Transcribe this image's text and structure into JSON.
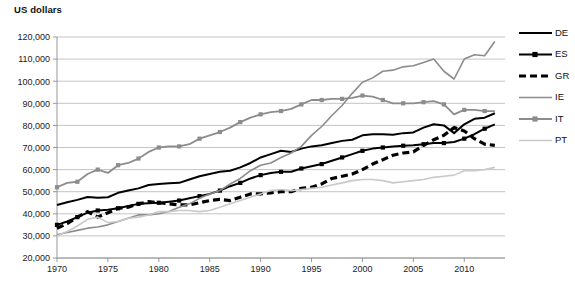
{
  "axis_title": "US dollars",
  "colors": {
    "DE": "#000000",
    "ES": "#000000",
    "GR": "#000000",
    "IE": "#8c8c8c",
    "IT": "#8c8c8c",
    "PT": "#c9c9c9",
    "grid": "#aaaaaa",
    "axis": "#8d8d8d"
  },
  "legend": {
    "position": "right",
    "items": [
      {
        "label": "DE",
        "style": "solid",
        "marker": "none",
        "color": "#000000",
        "width": 2.0
      },
      {
        "label": "ES",
        "style": "solid",
        "marker": "square",
        "color": "#000000",
        "width": 2.0
      },
      {
        "label": "GR",
        "style": "dashed",
        "marker": "none",
        "color": "#000000",
        "width": 3.2
      },
      {
        "label": "IE",
        "style": "solid",
        "marker": "none",
        "color": "#8c8c8c",
        "width": 1.6
      },
      {
        "label": "IT",
        "style": "solid",
        "marker": "square",
        "color": "#8c8c8c",
        "width": 1.8
      },
      {
        "label": "PT",
        "style": "solid",
        "marker": "none",
        "color": "#c9c9c9",
        "width": 1.6
      }
    ]
  },
  "chart_data": {
    "type": "line",
    "title": "",
    "xlabel": "",
    "ylabel": "US dollars",
    "xlim": [
      1970,
      2014
    ],
    "ylim": [
      20000,
      120000
    ],
    "ytick_values": [
      20000,
      30000,
      40000,
      50000,
      60000,
      70000,
      80000,
      90000,
      100000,
      110000,
      120000
    ],
    "ytick_labels": [
      "20,000",
      "30,000",
      "40,000",
      "50,000",
      "60,000",
      "70,000",
      "80,000",
      "90,000",
      "100,000",
      "110,000",
      "120,000"
    ],
    "xtick_values": [
      1970,
      1975,
      1980,
      1985,
      1990,
      1995,
      2000,
      2005,
      2010
    ],
    "xtick_labels": [
      "1970",
      "1975",
      "1980",
      "1985",
      "1990",
      "1995",
      "2000",
      "2005",
      "2010"
    ],
    "grid": "horizontal",
    "x": [
      1970,
      1971,
      1972,
      1973,
      1974,
      1975,
      1976,
      1977,
      1978,
      1979,
      1980,
      1981,
      1982,
      1983,
      1984,
      1985,
      1986,
      1987,
      1988,
      1989,
      1990,
      1991,
      1992,
      1993,
      1994,
      1995,
      1996,
      1997,
      1998,
      1999,
      2000,
      2001,
      2002,
      2003,
      2004,
      2005,
      2006,
      2007,
      2008,
      2009,
      2010,
      2011,
      2012,
      2013
    ],
    "series": [
      {
        "name": "DE",
        "values": [
          44000,
          45200,
          46300,
          47600,
          47300,
          47500,
          49500,
          50500,
          51500,
          53000,
          53500,
          53800,
          54000,
          55500,
          57000,
          58000,
          59000,
          59500,
          61000,
          63000,
          65500,
          67000,
          68500,
          68000,
          69500,
          70500,
          71000,
          72000,
          73000,
          73500,
          75500,
          76000,
          76000,
          75800,
          76500,
          76800,
          79000,
          80500,
          80000,
          76500,
          80500,
          83000,
          83500,
          85500
        ]
      },
      {
        "name": "ES",
        "values": [
          35000,
          36500,
          38500,
          40500,
          41500,
          41800,
          42500,
          43500,
          44500,
          44800,
          45000,
          45500,
          46000,
          47000,
          48000,
          49000,
          50500,
          52500,
          54000,
          56000,
          57500,
          58500,
          59000,
          59000,
          60500,
          61500,
          62500,
          64000,
          65500,
          67000,
          68500,
          69500,
          70000,
          70500,
          70800,
          71000,
          71500,
          72000,
          72000,
          72500,
          74000,
          76000,
          78500,
          80500
        ]
      },
      {
        "name": "GR",
        "values": [
          33500,
          35500,
          38500,
          41000,
          38500,
          40500,
          42500,
          43000,
          44500,
          45500,
          45000,
          44500,
          44000,
          44000,
          45000,
          46000,
          46500,
          46000,
          47500,
          49000,
          49000,
          49500,
          50000,
          50000,
          51500,
          52000,
          53500,
          56000,
          57000,
          58000,
          60000,
          62500,
          64500,
          66500,
          67500,
          68000,
          71000,
          73500,
          75500,
          79000,
          77500,
          74000,
          71500,
          71000
        ]
      },
      {
        "name": "IE",
        "values": [
          30500,
          31500,
          32500,
          33500,
          34000,
          35000,
          36500,
          38000,
          39500,
          39500,
          40000,
          41000,
          43000,
          44500,
          47000,
          49000,
          50500,
          53500,
          56000,
          59500,
          62000,
          63000,
          65500,
          67500,
          70500,
          75500,
          79500,
          84500,
          89000,
          94500,
          99500,
          101500,
          104500,
          105000,
          106500,
          107000,
          108500,
          110000,
          104500,
          101000,
          110000,
          112000,
          111500,
          118000
        ]
      },
      {
        "name": "IT",
        "values": [
          52000,
          54000,
          54500,
          58000,
          60000,
          58500,
          62000,
          63000,
          65000,
          68000,
          70000,
          70500,
          70500,
          71500,
          74000,
          75500,
          77000,
          79000,
          81500,
          83500,
          85000,
          86000,
          86500,
          87500,
          89500,
          91500,
          91500,
          92000,
          92000,
          92500,
          93500,
          93000,
          91500,
          90000,
          90000,
          90000,
          90500,
          91000,
          89500,
          85000,
          87000,
          87000,
          86500,
          86500
        ]
      },
      {
        "name": "PT",
        "values": [
          30000,
          32000,
          34500,
          37500,
          38500,
          36000,
          36500,
          38000,
          38500,
          39500,
          41000,
          41000,
          41500,
          41500,
          41000,
          41500,
          43000,
          44500,
          46000,
          47500,
          49000,
          50500,
          51000,
          50500,
          51000,
          51500,
          52000,
          53000,
          54000,
          55000,
          55500,
          55500,
          55000,
          54000,
          54500,
          55000,
          55500,
          56500,
          57000,
          57500,
          59500,
          59500,
          60000,
          61000
        ]
      }
    ]
  }
}
